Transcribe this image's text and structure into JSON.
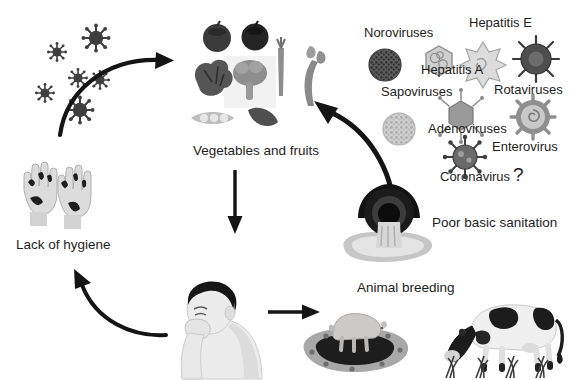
{
  "figure": {
    "type": "cycle-diagram",
    "palette": {
      "background": "#ffffff",
      "text": "#1d1d1d",
      "arrow": "#111111",
      "virus_dark": "#4a4a4a",
      "virus_mid": "#8c8c8c",
      "virus_light": "#c4c4c4",
      "produce_dark": "#3a3a3a",
      "produce_mid": "#8a8a8a",
      "sanitation_dark": "#1a1a1a",
      "puddle": "#b9b9b9",
      "animal_light": "#e2e2e2",
      "animal_dark": "#2b2b2b"
    }
  },
  "scene_labels": {
    "vegetables": "Vegetables and fruits",
    "hygiene": "Lack of hygiene",
    "sanitation": "Poor basic sanitation",
    "animals": "Animal breeding"
  },
  "virus_panel": {
    "items": [
      {
        "id": "norovirus",
        "label": "Noroviruses",
        "icon": "stippled-circle-dark"
      },
      {
        "id": "hepatitis_e",
        "label": "Hepatitis E",
        "icon": "star-capsid-light"
      },
      {
        "id": "hepatitis_a",
        "label": "Hepatitis A",
        "icon": "hexagon-capsid-light"
      },
      {
        "id": "rotavirus",
        "label": "Rotaviruses",
        "icon": "wheel-spiked-dark"
      },
      {
        "id": "sapovirus",
        "label": "Sapoviruses",
        "icon": "stippled-circle-light"
      },
      {
        "id": "adenovirus",
        "label": "Adenoviruses",
        "icon": "hexagon-fiber-gray"
      },
      {
        "id": "enterovirus",
        "label": "Enterovirus",
        "icon": "gear-spiral-gray"
      },
      {
        "id": "coronavirus",
        "label": "Coronavirus",
        "icon": "corona-spiked-dark"
      }
    ],
    "query_marker": "?"
  },
  "flow": {
    "arrows": [
      {
        "id": "virus-to-produce",
        "style": "curved",
        "from": "free-viruses",
        "to": "vegetables"
      },
      {
        "id": "produce-to-person",
        "style": "straight-down",
        "from": "vegetables",
        "to": "person"
      },
      {
        "id": "person-to-hygiene",
        "style": "curved",
        "from": "person",
        "to": "hygiene"
      },
      {
        "id": "person-to-animals",
        "style": "straight-right",
        "from": "person",
        "to": "animals"
      },
      {
        "id": "sanitation-to-produce",
        "style": "curved-thick",
        "from": "sanitation",
        "to": "vegetables"
      }
    ]
  },
  "illustrations": {
    "free_viruses": "scattered spiked virus particles",
    "produce": [
      "tomato",
      "tomato",
      "lettuce",
      "broccoli",
      "carrot",
      "leafy-greens",
      "pea-pod",
      "cucumber"
    ],
    "hands": "two contaminated hands",
    "person": "person coughing into hand",
    "sanitation": "sewage pipe discharging into puddle",
    "animals": [
      "pig in mud wallow",
      "grazing cow"
    ]
  }
}
